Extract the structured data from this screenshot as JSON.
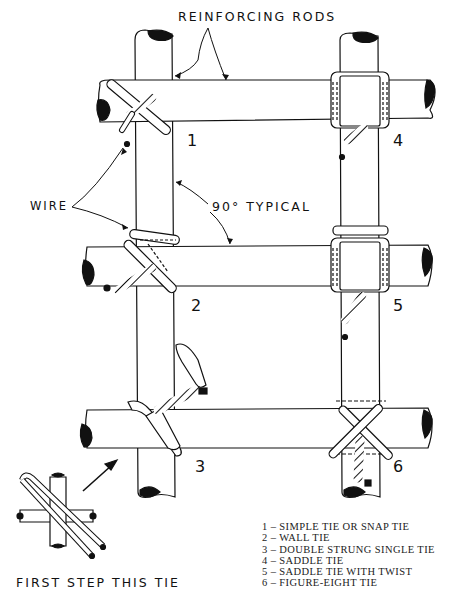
{
  "labels": {
    "reinforcing_rods": "REINFORCING RODS",
    "wire": "WIRE",
    "angle": "90° TYPICAL",
    "first_step": "FIRST STEP THIS TIE"
  },
  "tie_numbers": [
    "1",
    "2",
    "3",
    "4",
    "5",
    "6"
  ],
  "legend": [
    "1 – SIMPLE TIE OR SNAP TIE",
    "2 – WALL TIE",
    "3 – DOUBLE STRUNG SINGLE TIE",
    "4 – SADDLE TIE",
    "5 – SADDLE TIE WITH TWIST",
    "6 – FIGURE-EIGHT TIE"
  ],
  "colors": {
    "ink": "#111111",
    "paper": "#ffffff"
  }
}
